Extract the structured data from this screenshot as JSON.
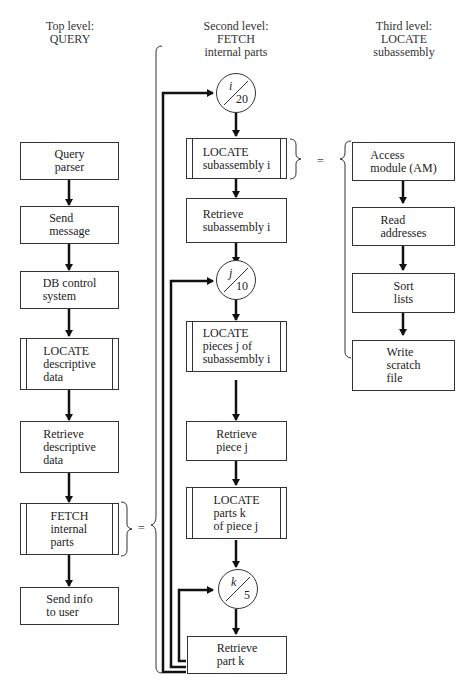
{
  "headers": {
    "top": {
      "line1": "Top level:",
      "line2": "QUERY"
    },
    "second": {
      "line1": "Second level:",
      "line2": "FETCH",
      "line3": "internal parts"
    },
    "third": {
      "line1": "Third level:",
      "line2": "LOCATE",
      "line3": "subassembly"
    }
  },
  "top_level": [
    {
      "id": "query-parser",
      "text": "Query\nparser",
      "type": "process"
    },
    {
      "id": "send-message",
      "text": "Send\nmessage",
      "type": "process"
    },
    {
      "id": "db-control-system",
      "text": "DB control\nsystem",
      "type": "process"
    },
    {
      "id": "locate-descriptive-data",
      "text": "LOCATE\ndescriptive\ndata",
      "type": "subprocess"
    },
    {
      "id": "retrieve-descriptive-data",
      "text": "Retrieve\ndescriptive\ndata",
      "type": "process"
    },
    {
      "id": "fetch-internal-parts",
      "text": "FETCH\ninternal\nparts",
      "type": "subprocess"
    },
    {
      "id": "send-info-to-user",
      "text": "Send info\nto user",
      "type": "process"
    }
  ],
  "second_level": {
    "loop_i": {
      "var": "i",
      "count": "20"
    },
    "locate_subassembly": "LOCATE\nsubassembly i",
    "retrieve_subassembly": "Retrieve\nsubassembly i",
    "loop_j": {
      "var": "j",
      "count": "10"
    },
    "locate_pieces": "LOCATE\npieces j of\nsubassembly i",
    "retrieve_piece": "Retrieve\npiece j",
    "locate_parts": "LOCATE\nparts k\nof piece j",
    "loop_k": {
      "var": "k",
      "count": "5"
    },
    "retrieve_part": "Retrieve\npart k"
  },
  "third_level": [
    {
      "id": "access-module",
      "text": "Access\nmodule (AM)"
    },
    {
      "id": "read-addresses",
      "text": "Read\naddresses"
    },
    {
      "id": "sort-lists",
      "text": "Sort\nlists"
    },
    {
      "id": "write-scratch-file",
      "text": "Write\nscratch\nfile"
    }
  ],
  "equals_sign": "="
}
